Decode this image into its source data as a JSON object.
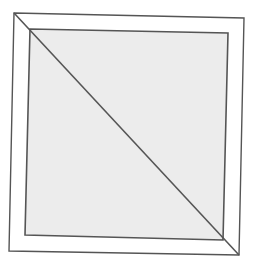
{
  "figure": {
    "colors": {
      "background": "#ffffff",
      "frame_fill": "#ffffff",
      "inner_fill": "#ececec",
      "stroke": "#555555"
    },
    "outer_square": [
      [
        14,
        13
      ],
      [
        244,
        18
      ],
      [
        239,
        255
      ],
      [
        9,
        251
      ]
    ],
    "inner_square": [
      [
        30,
        29
      ],
      [
        228,
        33
      ],
      [
        223,
        240
      ],
      [
        25,
        235
      ]
    ],
    "diagonal": [
      [
        14,
        13
      ],
      [
        239,
        255
      ]
    ],
    "corner_miter_bottom_right": [
      [
        223,
        240
      ],
      [
        239,
        255
      ]
    ],
    "corner_miter_top_left": [
      [
        14,
        13
      ],
      [
        30,
        29
      ]
    ]
  }
}
